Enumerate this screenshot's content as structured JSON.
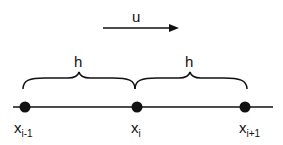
{
  "diagram": {
    "velocity": {
      "label": "u",
      "direction": "right"
    },
    "spacing": [
      {
        "label": "h",
        "from": "x_{i-1}",
        "to": "x_i"
      },
      {
        "label": "h",
        "from": "x_i",
        "to": "x_{i+1}"
      }
    ],
    "nodes": [
      {
        "base": "x",
        "sub": "i-1"
      },
      {
        "base": "x",
        "sub": "i"
      },
      {
        "base": "x",
        "sub": "i+1"
      }
    ],
    "colors": {
      "stroke": "#111111",
      "background": "#ffffff"
    }
  }
}
